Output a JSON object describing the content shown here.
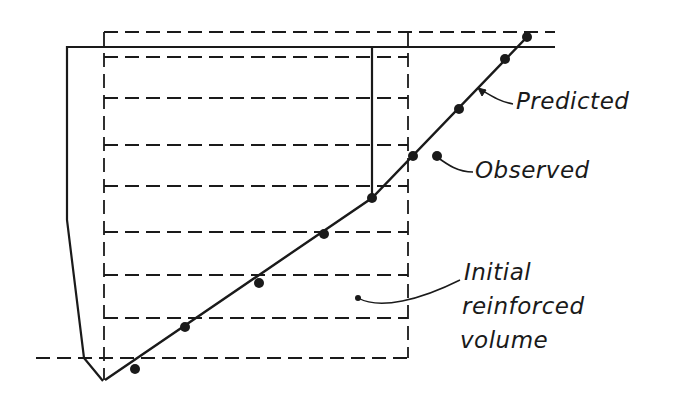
{
  "diagram": {
    "type": "reinforced wall cross-section",
    "labels": {
      "predicted": "Predicted",
      "observed": "Observed",
      "initial_volume_line1": "Initial",
      "initial_volume_line2": "reinforced",
      "initial_volume_line3": "volume"
    },
    "colors": {
      "ink": "#1a1a1a",
      "background": "#ffffff"
    }
  }
}
